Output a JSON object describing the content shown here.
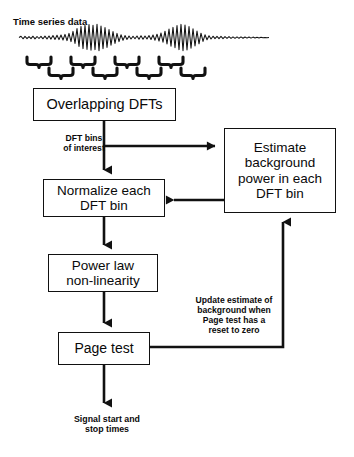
{
  "diagram": {
    "title_label": "Time series data",
    "nodes": [
      {
        "id": "overlapping-dfts",
        "label": "Overlapping DFTs"
      },
      {
        "id": "normalize-dft-bin",
        "label": "Normalize each\nDFT bin"
      },
      {
        "id": "power-law-nonlinearity",
        "label": "Power law\nnon-linearity"
      },
      {
        "id": "page-test",
        "label": "Page test"
      },
      {
        "id": "estimate-background-power",
        "label": "Estimate\nbackground\npower in each\nDFT bin"
      }
    ],
    "edge_labels": [
      {
        "id": "dft-bins-of-interest",
        "label": "DFT bins\nof interest"
      },
      {
        "id": "update-estimate",
        "label": "Update estimate of\nbackground when\nPage test has a\nreset to zero"
      }
    ],
    "output_label": "Signal start and\nstop times",
    "colors": {
      "stroke": "#111111",
      "fill": "#ffffff",
      "text": "#0a0a0a"
    },
    "waveform": {
      "description": "noisy-time-series-with-two-transient-bursts"
    },
    "brackets": {
      "row_top_count": 4,
      "row_bottom_count": 4,
      "description": "staggered-underbrace-windows-showing-overlap"
    }
  }
}
